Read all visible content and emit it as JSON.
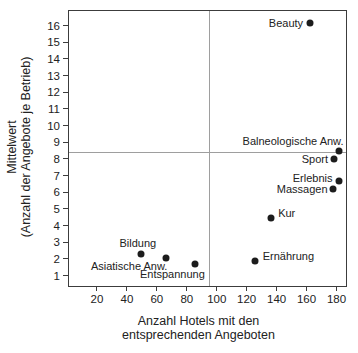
{
  "chart_data": {
    "type": "scatter",
    "xlabel_lines": [
      "Anzahl Hotels mit den",
      "entsprechenden Angeboten"
    ],
    "ylabel_lines": [
      "Mittelwert",
      "(Anzahl der Angebote je Betrieb)"
    ],
    "xlim": [
      1,
      186
    ],
    "ylim": [
      0.4,
      16.9
    ],
    "xticks": [
      20,
      40,
      60,
      80,
      100,
      120,
      140,
      160,
      180
    ],
    "yticks": [
      1,
      2,
      3,
      4,
      5,
      6,
      7,
      8,
      9,
      10,
      11,
      12,
      13,
      14,
      15,
      16
    ],
    "grid": false,
    "legend": "none",
    "reference_lines": {
      "vertical_x": 94.5,
      "horizontal_y": 8.45
    },
    "points": [
      {
        "label": "Beauty",
        "x": 162,
        "y": 16.2,
        "anchor": "left",
        "dx": -7,
        "dy": 0
      },
      {
        "label": "Balneologische Anw.",
        "x": 181,
        "y": 8.5,
        "anchor": "above-right",
        "dx": 5,
        "dy": -4
      },
      {
        "label": "Sport",
        "x": 178,
        "y": 8.0,
        "anchor": "left",
        "dx": -6,
        "dy": 0
      },
      {
        "label": "Erlebnis",
        "x": 181,
        "y": 6.7,
        "anchor": "left",
        "dx": -6,
        "dy": -3
      },
      {
        "label": "Massagen",
        "x": 177,
        "y": 6.2,
        "anchor": "left",
        "dx": -5,
        "dy": 0
      },
      {
        "label": "Kur",
        "x": 136,
        "y": 4.5,
        "anchor": "right",
        "dx": 7,
        "dy": -5
      },
      {
        "label": "Ernährung",
        "x": 125,
        "y": 1.9,
        "anchor": "right",
        "dx": 8,
        "dy": -5
      },
      {
        "label": "Bildung",
        "x": 49,
        "y": 2.3,
        "anchor": "above-center",
        "dx": -3,
        "dy": -5
      },
      {
        "label": "Asiatische Anw.",
        "x": 66,
        "y": 2.1,
        "anchor": "below-right",
        "dx": 1,
        "dy": 3
      },
      {
        "label": "Entspannung",
        "x": 85,
        "y": 1.7,
        "anchor": "below-right",
        "dx": 10,
        "dy": 5
      }
    ],
    "marker": {
      "shape": "circle",
      "diameter_px": 7
    },
    "colors": {
      "marker": "#1c1c1c",
      "reference_line": "#9e9e9e",
      "frame": "#3c3c3c",
      "text": "#222222",
      "background": "#ffffff"
    }
  }
}
